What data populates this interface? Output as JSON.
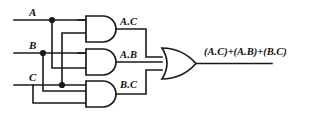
{
  "diagram": {
    "background_color": "#ffffff",
    "line_color": "#1a1a1a"
  },
  "inputs": [
    {
      "label": "A",
      "name": "input-a"
    },
    {
      "label": "B",
      "name": "input-b"
    },
    {
      "label": "C",
      "name": "input-c"
    }
  ],
  "gates": [
    {
      "type": "AND",
      "name": "and-gate-ac",
      "output_label": "A.C"
    },
    {
      "type": "AND",
      "name": "and-gate-ab",
      "output_label": "A.B"
    },
    {
      "type": "AND",
      "name": "and-gate-bc",
      "output_label": "B.C"
    },
    {
      "type": "OR",
      "name": "or-gate",
      "output_label": "(A.C)+(A.B)+(B.C)"
    }
  ],
  "output": {
    "label": "(A.C)+(A.B)+(B.C)"
  }
}
